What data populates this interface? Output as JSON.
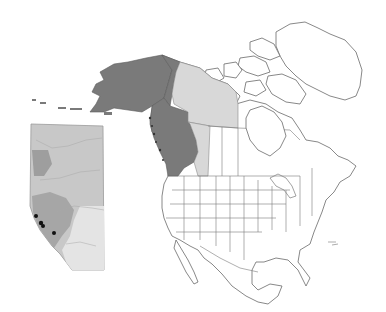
{
  "map": {
    "type": "range-map",
    "region": "North America",
    "labels": [],
    "colors": {
      "background": "#ffffff",
      "land": "#ffffff",
      "outline": "#6a6a6a",
      "native_range": "#7a7a7a",
      "secondary_range": "#d8d8d8",
      "inset_base": "#c8c8c8",
      "inset_light": "#e6e6e6",
      "inset_dark": "#9a9a9a",
      "occurrence_point": "#111111"
    },
    "highlighted_regions": [
      {
        "name": "Alaska",
        "shade": "dark"
      },
      {
        "name": "Yukon",
        "shade": "dark"
      },
      {
        "name": "British Columbia",
        "shade": "dark"
      },
      {
        "name": "Northwest Territories (mainland)",
        "shade": "light"
      },
      {
        "name": "Alberta",
        "shade": "light"
      }
    ],
    "inset": {
      "name": "Alberta detail",
      "occurrence_points": [
        {
          "x": 36,
          "y": 216
        },
        {
          "x": 41,
          "y": 223
        },
        {
          "x": 43,
          "y": 226
        },
        {
          "x": 54,
          "y": 233
        }
      ]
    }
  }
}
